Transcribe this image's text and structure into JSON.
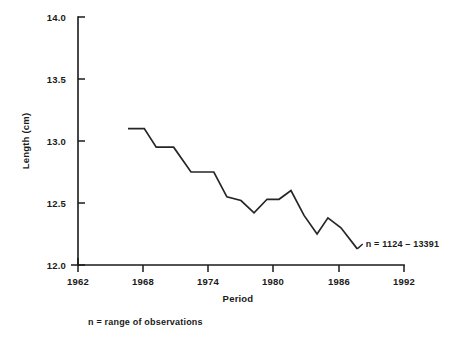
{
  "chart_data": {
    "type": "line",
    "title": "",
    "xlabel": "Period",
    "ylabel": "Length (cm)",
    "xlim": [
      1962,
      1992
    ],
    "ylim": [
      12.0,
      14.0
    ],
    "grid": false,
    "legend": "none",
    "x_ticks": [
      "1962",
      "1968",
      "1974",
      "1980",
      "1986",
      "1992"
    ],
    "x_tick_values": [
      1962,
      1968,
      1974,
      1980,
      1986,
      1992
    ],
    "y_ticks": [
      "12.0",
      "12.5",
      "13.0",
      "13.5",
      "14.0"
    ],
    "y_tick_values": [
      12.0,
      12.5,
      13.0,
      13.5,
      14.0
    ],
    "series": [
      {
        "name": "Length",
        "x": [
          1966.6,
          1968.1,
          1969.2,
          1970.8,
          1972.4,
          1974.5,
          1975.7,
          1977.0,
          1978.2,
          1979.4,
          1980.5,
          1981.6,
          1982.8,
          1984.0,
          1985.0,
          1986.2,
          1987.7
        ],
        "values": [
          13.1,
          13.1,
          12.95,
          12.95,
          12.75,
          12.75,
          12.55,
          12.52,
          12.42,
          12.53,
          12.53,
          12.6,
          12.4,
          12.25,
          12.38,
          12.3,
          12.13
        ]
      }
    ],
    "annotations": [
      {
        "name": "n-range-annotation",
        "text": "n = 1124 – 13391",
        "x": 1988.2,
        "y": 12.17
      }
    ],
    "footnote": "n = range of observations"
  },
  "axis": {
    "y_label": "Length (cm)",
    "x_label": "Period"
  }
}
